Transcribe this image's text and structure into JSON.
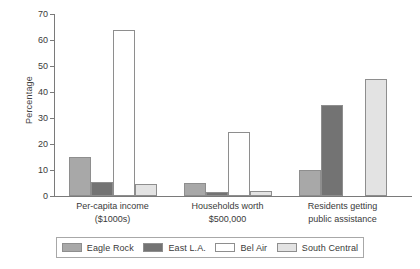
{
  "chart_data": {
    "type": "bar",
    "title": "",
    "xlabel": "",
    "ylabel": "Percentage",
    "ylim": [
      0,
      70
    ],
    "yticks": [
      0,
      10,
      20,
      30,
      40,
      50,
      60,
      70
    ],
    "ytick_labels": [
      "0",
      "10",
      "20",
      "30",
      "40",
      "50",
      "60",
      "70"
    ],
    "grid": false,
    "legend_position": "bottom",
    "categories": [
      "Per-capita income\n($1000s)",
      "Households worth\n$500,000",
      "Residents getting\npublic assistance"
    ],
    "category_lines": [
      [
        "Per-capita income",
        "($1000s)"
      ],
      [
        "Households worth",
        "$500,000"
      ],
      [
        "Residents getting",
        "public assistance"
      ]
    ],
    "series": [
      {
        "name": "Eagle Rock",
        "color": "#a8a8a8",
        "values": [
          15.0,
          5.0,
          10.0
        ]
      },
      {
        "name": "East L.A.",
        "color": "#737373",
        "values": [
          5.5,
          1.5,
          35.0
        ]
      },
      {
        "name": "Bel Air",
        "color": "#ffffff",
        "values": [
          64.0,
          24.5,
          0.0
        ]
      },
      {
        "name": "South Central",
        "color": "#e3e3e3",
        "values": [
          4.8,
          2.0,
          45.0
        ]
      }
    ]
  },
  "axis": {
    "y_title": "Percentage"
  },
  "legend": {
    "items": [
      {
        "label": "Eagle Rock"
      },
      {
        "label": "East L.A."
      },
      {
        "label": "Bel Air"
      },
      {
        "label": "South Central"
      }
    ]
  }
}
